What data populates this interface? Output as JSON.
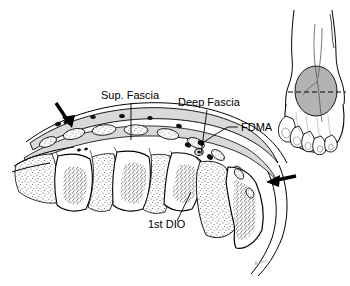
{
  "figure": {
    "background_color": "#ffffff",
    "ink_color": "#000000",
    "fascia_fill": "#d9d9d9",
    "bone_fill": "#ffffff",
    "muscle_stipple": "#555555",
    "inset_fill": "#b3b3b3"
  },
  "labels": [
    {
      "id": "sup-fascia",
      "text": "Sup. Fascia",
      "x": 101,
      "y": 99,
      "anchor": "start",
      "leader": {
        "x1": 131,
        "y1": 103,
        "x2": 131,
        "y2": 140
      }
    },
    {
      "id": "deep-fascia",
      "text": "Deep Fascia",
      "x": 178,
      "y": 106,
      "anchor": "start",
      "leader": {
        "x1": 207,
        "y1": 110,
        "x2": 201,
        "y2": 154
      }
    },
    {
      "id": "fdma",
      "text": "FDMA",
      "x": 241,
      "y": 131,
      "anchor": "start",
      "leader": {
        "x1": 237,
        "y1": 127,
        "x2": 203,
        "y2": 143
      }
    },
    {
      "id": "first-dio",
      "text": "1st DIO",
      "x": 148,
      "y": 228,
      "anchor": "start",
      "leader": {
        "x1": 177,
        "y1": 221,
        "x2": 190,
        "y2": 193
      }
    }
  ],
  "arrows": [
    {
      "id": "arrow-proximal-dorsal",
      "tip_x": 71,
      "tip_y": 127,
      "angle_deg": 58,
      "length": 26
    },
    {
      "id": "arrow-distal-lateral",
      "tip_x": 263,
      "tip_y": 182,
      "angle_deg": 200,
      "length": 26
    }
  ],
  "inset": {
    "id": "foot-orientation-inset",
    "description": "Dorsal view of right foot with shaded oval marking the region and a dashed section line",
    "x": 281,
    "y": 8,
    "width": 66,
    "height": 152,
    "oval": {
      "cx": 316,
      "cy": 91,
      "rx": 21,
      "ry": 25
    },
    "section_line": {
      "x1": 288,
      "y1": 92,
      "x2": 346,
      "y2": 92,
      "style": "dashed"
    }
  },
  "signature": {
    "text": "K. Lee",
    "x": 255,
    "y": 265
  }
}
